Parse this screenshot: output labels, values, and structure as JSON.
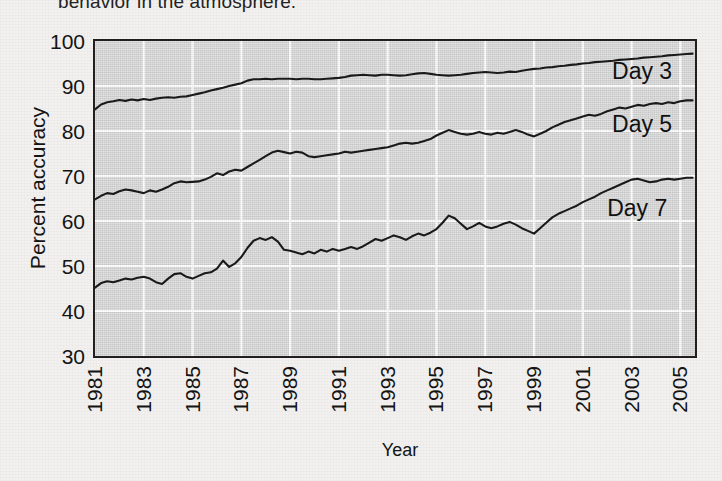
{
  "caption": {
    "text": "behavior in the atmosphere."
  },
  "colors": {
    "plot_background": "#d6d6d6",
    "page_background": "#f2f1ef",
    "gridline": "#ffffff",
    "axis": "#231f20",
    "series_line": "#1a1a1a"
  },
  "chart_data": {
    "type": "line",
    "title": "",
    "xlabel": "Year",
    "ylabel": "Percent accuracy",
    "xlim": [
      1981,
      2005.6
    ],
    "ylim": [
      30,
      100
    ],
    "yticks": [
      30,
      40,
      50,
      60,
      70,
      80,
      90,
      100
    ],
    "xticks": [
      1981,
      1983,
      1985,
      1987,
      1989,
      1991,
      1993,
      1995,
      1997,
      1999,
      2001,
      2003,
      2005
    ],
    "grid": true,
    "legend_position": "inline-right",
    "annotations": [
      {
        "label": "Day 3",
        "x": 2002.2,
        "y": 93.2
      },
      {
        "label": "Day 5",
        "x": 2002.2,
        "y": 81.4
      },
      {
        "label": "Day 7",
        "x": 2002.0,
        "y": 62.6
      }
    ],
    "x": [
      1981.0,
      1981.25,
      1981.5,
      1981.75,
      1982.0,
      1982.25,
      1982.5,
      1982.75,
      1983.0,
      1983.25,
      1983.5,
      1983.75,
      1984.0,
      1984.25,
      1984.5,
      1984.75,
      1985.0,
      1985.25,
      1985.5,
      1985.75,
      1986.0,
      1986.25,
      1986.5,
      1986.75,
      1987.0,
      1987.25,
      1987.5,
      1987.75,
      1988.0,
      1988.25,
      1988.5,
      1988.75,
      1989.0,
      1989.25,
      1989.5,
      1989.75,
      1990.0,
      1990.25,
      1990.5,
      1990.75,
      1991.0,
      1991.25,
      1991.5,
      1991.75,
      1992.0,
      1992.25,
      1992.5,
      1992.75,
      1993.0,
      1993.25,
      1993.5,
      1993.75,
      1994.0,
      1994.25,
      1994.5,
      1994.75,
      1995.0,
      1995.25,
      1995.5,
      1995.75,
      1996.0,
      1996.25,
      1996.5,
      1996.75,
      1997.0,
      1997.25,
      1997.5,
      1997.75,
      1998.0,
      1998.25,
      1998.5,
      1998.75,
      1999.0,
      1999.25,
      1999.5,
      1999.75,
      2000.0,
      2000.25,
      2000.5,
      2000.75,
      2001.0,
      2001.25,
      2001.5,
      2001.75,
      2002.0,
      2002.25,
      2002.5,
      2002.75,
      2003.0,
      2003.25,
      2003.5,
      2003.75,
      2004.0,
      2004.25,
      2004.5,
      2004.75,
      2005.0,
      2005.25,
      2005.5
    ],
    "series": [
      {
        "name": "Day 3",
        "label": "Day 3",
        "start_value": 84.8,
        "end_value": 97.2,
        "values": [
          84.8,
          85.9,
          86.4,
          86.6,
          86.9,
          86.7,
          87.0,
          86.8,
          87.1,
          86.9,
          87.2,
          87.4,
          87.5,
          87.4,
          87.6,
          87.7,
          88.0,
          88.3,
          88.6,
          89.0,
          89.3,
          89.6,
          90.0,
          90.3,
          90.6,
          91.2,
          91.5,
          91.5,
          91.6,
          91.5,
          91.6,
          91.6,
          91.6,
          91.5,
          91.6,
          91.6,
          91.5,
          91.5,
          91.6,
          91.7,
          91.8,
          92.0,
          92.3,
          92.4,
          92.5,
          92.4,
          92.3,
          92.5,
          92.5,
          92.4,
          92.3,
          92.4,
          92.6,
          92.8,
          92.9,
          92.7,
          92.5,
          92.4,
          92.3,
          92.4,
          92.5,
          92.7,
          92.9,
          93.0,
          93.1,
          93.0,
          92.9,
          93.0,
          93.2,
          93.1,
          93.4,
          93.6,
          93.8,
          93.9,
          94.1,
          94.2,
          94.4,
          94.5,
          94.7,
          94.8,
          95.0,
          95.1,
          95.3,
          95.4,
          95.5,
          95.6,
          95.8,
          95.9,
          96.0,
          96.1,
          96.3,
          96.4,
          96.5,
          96.6,
          96.8,
          96.9,
          97.0,
          97.1,
          97.2
        ]
      },
      {
        "name": "Day 5",
        "label": "Day 5",
        "start_value": 64.8,
        "end_value": 86.8,
        "values": [
          64.8,
          65.6,
          66.2,
          66.0,
          66.6,
          67.0,
          66.8,
          66.5,
          66.2,
          66.8,
          66.5,
          67.0,
          67.6,
          68.4,
          68.8,
          68.6,
          68.7,
          68.8,
          69.2,
          69.8,
          70.6,
          70.2,
          71.0,
          71.4,
          71.2,
          72.0,
          72.8,
          73.6,
          74.4,
          75.2,
          75.6,
          75.3,
          75.0,
          75.4,
          75.2,
          74.4,
          74.2,
          74.4,
          74.6,
          74.8,
          75.0,
          75.4,
          75.2,
          75.4,
          75.6,
          75.8,
          76.0,
          76.2,
          76.4,
          76.8,
          77.2,
          77.4,
          77.2,
          77.4,
          77.8,
          78.2,
          79.0,
          79.6,
          80.2,
          79.8,
          79.4,
          79.2,
          79.4,
          79.8,
          79.4,
          79.2,
          79.6,
          79.4,
          79.8,
          80.2,
          79.8,
          79.2,
          78.8,
          79.4,
          80.0,
          80.8,
          81.4,
          82.0,
          82.4,
          82.8,
          83.2,
          83.6,
          83.4,
          83.8,
          84.4,
          84.8,
          85.2,
          85.0,
          85.4,
          85.8,
          85.6,
          86.0,
          86.2,
          86.0,
          86.4,
          86.2,
          86.6,
          86.8,
          86.8
        ]
      },
      {
        "name": "Day 7",
        "label": "Day 7",
        "start_value": 45.2,
        "end_value": 69.6,
        "values": [
          45.2,
          46.2,
          46.6,
          46.4,
          46.8,
          47.2,
          47.0,
          47.4,
          47.6,
          47.2,
          46.4,
          46.0,
          47.2,
          48.2,
          48.4,
          47.6,
          47.2,
          47.8,
          48.4,
          48.6,
          49.4,
          51.2,
          49.8,
          50.6,
          52.0,
          54.0,
          55.6,
          56.2,
          55.8,
          56.4,
          55.4,
          53.6,
          53.4,
          53.0,
          52.6,
          53.2,
          52.8,
          53.6,
          53.2,
          53.8,
          53.4,
          53.8,
          54.2,
          53.8,
          54.4,
          55.2,
          56.0,
          55.6,
          56.2,
          56.8,
          56.4,
          55.8,
          56.6,
          57.2,
          56.8,
          57.4,
          58.2,
          59.6,
          61.2,
          60.6,
          59.4,
          58.2,
          58.8,
          59.6,
          58.8,
          58.4,
          58.8,
          59.4,
          59.8,
          59.2,
          58.4,
          57.8,
          57.2,
          58.4,
          59.6,
          60.8,
          61.6,
          62.2,
          62.8,
          63.4,
          64.2,
          64.8,
          65.4,
          66.2,
          66.8,
          67.4,
          68.0,
          68.6,
          69.2,
          69.4,
          69.0,
          68.6,
          68.8,
          69.2,
          69.4,
          69.2,
          69.4,
          69.6,
          69.6
        ]
      }
    ]
  }
}
